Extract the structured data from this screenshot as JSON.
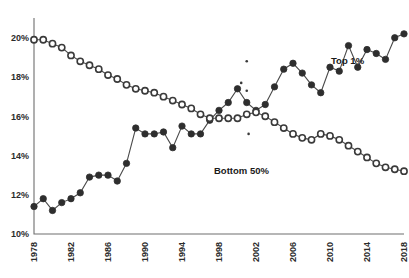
{
  "chart_data": {
    "type": "line",
    "title": "",
    "subtitle": "",
    "xlabel": "",
    "ylabel": "",
    "xlim": [
      1978,
      2018
    ],
    "ylim": [
      10,
      20.6
    ],
    "grid": false,
    "legend_position": "inline-annotation",
    "y_tick_labels": [
      "20%",
      "18%",
      "16%",
      "14%",
      "12%",
      "10%"
    ],
    "y_ticks": [
      20,
      18,
      16,
      14,
      12,
      10
    ],
    "x_tick_labels": [
      "1978",
      "1982",
      "1986",
      "1990",
      "1994",
      "1998",
      "2002",
      "2006",
      "2010",
      "2014",
      "2018"
    ],
    "x_ticks": [
      1978,
      1982,
      1986,
      1990,
      1994,
      1998,
      2002,
      2006,
      2010,
      2014,
      2018
    ],
    "x": [
      1978,
      1979,
      1980,
      1981,
      1982,
      1983,
      1984,
      1985,
      1986,
      1987,
      1988,
      1989,
      1990,
      1991,
      1992,
      1993,
      1994,
      1995,
      1996,
      1997,
      1998,
      1999,
      2000,
      2001,
      2002,
      2003,
      2004,
      2005,
      2006,
      2007,
      2008,
      2009,
      2010,
      2011,
      2012,
      2013,
      2014,
      2015,
      2016,
      2017,
      2018
    ],
    "series": [
      {
        "name": "Top 1%",
        "marker": "filled-circle",
        "annotation": "Top 1%",
        "values": [
          11.4,
          11.8,
          11.2,
          11.6,
          11.8,
          12.1,
          12.9,
          13.0,
          13.0,
          12.7,
          13.6,
          15.4,
          15.1,
          15.1,
          15.2,
          14.4,
          15.5,
          15.1,
          15.1,
          15.8,
          16.3,
          16.7,
          17.4,
          16.7,
          16.3,
          16.6,
          17.5,
          18.4,
          18.7,
          18.2,
          17.6,
          17.2,
          18.5,
          18.3,
          19.6,
          18.5,
          19.4,
          19.2,
          18.9,
          20.0,
          20.2
        ]
      },
      {
        "name": "Bottom 50%",
        "marker": "open-circle",
        "annotation": "Bottom 50%",
        "values": [
          19.9,
          19.9,
          19.7,
          19.5,
          19.1,
          18.8,
          18.6,
          18.4,
          18.1,
          17.9,
          17.6,
          17.4,
          17.3,
          17.2,
          17.0,
          16.8,
          16.6,
          16.4,
          16.1,
          15.9,
          15.9,
          15.9,
          15.9,
          16.1,
          16.2,
          16.0,
          15.7,
          15.4,
          15.1,
          14.9,
          14.8,
          15.1,
          15.0,
          14.8,
          14.5,
          14.2,
          13.9,
          13.6,
          13.4,
          13.3,
          13.2
        ]
      }
    ],
    "specks": [
      {
        "x": 2001.0,
        "y": 18.8
      },
      {
        "x": 2000.4,
        "y": 17.7
      },
      {
        "x": 2001.0,
        "y": 17.3
      },
      {
        "x": 2001.2,
        "y": 15.1
      }
    ]
  },
  "labels": {
    "top_series": "Top 1%",
    "bottom_series": "Bottom 50%"
  },
  "colors": {
    "filled_marker": "#2e2e2e",
    "open_marker_stroke": "#3a3a3a",
    "line": "#4a4a4a",
    "axis": "#6e6e6e",
    "text": "#1a1a1a",
    "background": "#ffffff"
  }
}
